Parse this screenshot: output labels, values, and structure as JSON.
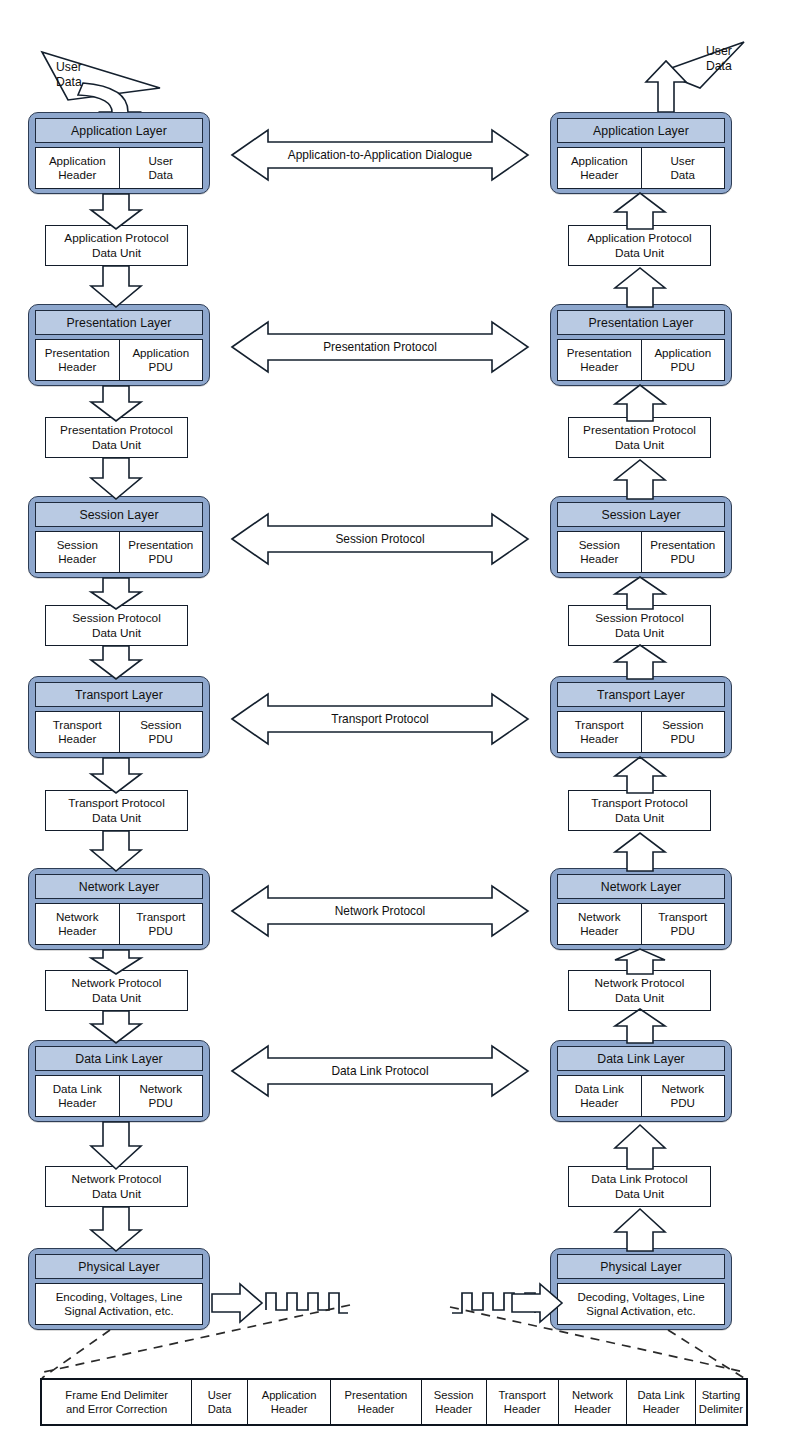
{
  "diagram": {
    "colors": {
      "layer_fill": "#8ea7cd",
      "layer_title_fill": "#b9cae3",
      "outline": "#14202e",
      "page_background": "#ffffff"
    }
  },
  "left_stack": {
    "side_label": "sending-host",
    "user_data_flag": "User\nData",
    "layers": [
      {
        "title": "Application Layer",
        "pdu_cells": [
          "Application\nHeader",
          "User\nData"
        ]
      },
      {
        "title": "Presentation Layer",
        "pdu_cells": [
          "Presentation\nHeader",
          "Application\nPDU"
        ]
      },
      {
        "title": "Session Layer",
        "pdu_cells": [
          "Session\nHeader",
          "Presentation\nPDU"
        ]
      },
      {
        "title": "Transport Layer",
        "pdu_cells": [
          "Transport\nHeader",
          "Session\nPDU"
        ]
      },
      {
        "title": "Network Layer",
        "pdu_cells": [
          "Network\nHeader",
          "Transport\nPDU"
        ]
      },
      {
        "title": "Data Link Layer",
        "pdu_cells": [
          "Data Link\nHeader",
          "Network\nPDU"
        ]
      },
      {
        "title": "Physical Layer",
        "pdu_cells": [
          "Encoding, Voltages, Line\nSignal Activation, etc."
        ]
      }
    ],
    "pdu_boxes": [
      "Application Protocol\nData Unit",
      "Presentation Protocol\nData Unit",
      "Session Protocol\nData Unit",
      "Transport Protocol\nData Unit",
      "Network Protocol\nData Unit",
      "Network Protocol\nData Unit"
    ]
  },
  "right_stack": {
    "side_label": "receiving-host",
    "user_data_flag": "User\nData",
    "layers": [
      {
        "title": "Application Layer",
        "pdu_cells": [
          "Application\nHeader",
          "User\nData"
        ]
      },
      {
        "title": "Presentation Layer",
        "pdu_cells": [
          "Presentation\nHeader",
          "Application\nPDU"
        ]
      },
      {
        "title": "Session Layer",
        "pdu_cells": [
          "Session\nHeader",
          "Presentation\nPDU"
        ]
      },
      {
        "title": "Transport Layer",
        "pdu_cells": [
          "Transport\nHeader",
          "Session\nPDU"
        ]
      },
      {
        "title": "Network Layer",
        "pdu_cells": [
          "Network\nHeader",
          "Transport\nPDU"
        ]
      },
      {
        "title": "Data Link Layer",
        "pdu_cells": [
          "Data Link\nHeader",
          "Network\nPDU"
        ]
      },
      {
        "title": "Physical Layer",
        "pdu_cells": [
          "Decoding, Voltages, Line\nSignal Activation, etc."
        ]
      }
    ],
    "pdu_boxes": [
      "Application Protocol\nData Unit",
      "Presentation Protocol\nData Unit",
      "Session Protocol\nData Unit",
      "Transport Protocol\nData Unit",
      "Network Protocol\nData Unit",
      "Data Link Protocol\nData Unit"
    ]
  },
  "peer_protocols": [
    "Application-to-Application Dialogue",
    "Presentation Protocol",
    "Session Protocol",
    "Transport Protocol",
    "Network Protocol",
    "Data Link Protocol"
  ],
  "frame_table": {
    "cells": [
      "Frame End Delimiter\nand Error Correction",
      "User\nData",
      "Application\nHeader",
      "Presentation\nHeader",
      "Session\nHeader",
      "Transport\nHeader",
      "Network\nHeader",
      "Data Link\nHeader",
      "Starting\nDelimiter"
    ],
    "widths": [
      162,
      60,
      90,
      98,
      70,
      78,
      74,
      74,
      88
    ]
  },
  "physical_medium": {
    "left_signal": "square-wave-signal",
    "right_signal": "square-wave-signal"
  }
}
